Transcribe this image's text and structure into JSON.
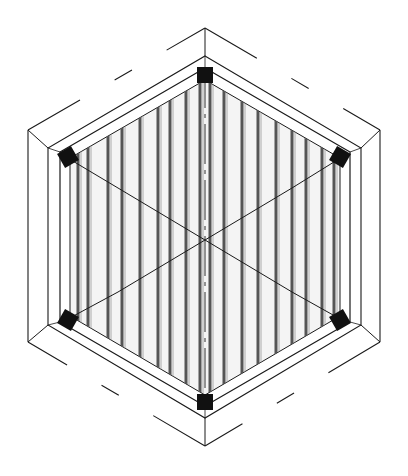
{
  "figure": {
    "type": "isometric technical drawing",
    "colors": {
      "background": "#ffffff",
      "line": "#1a1a1a",
      "fill_panel": "#f4f4f4",
      "slat_dark": "#555555",
      "block": "#111111"
    },
    "outer_hexagon": {
      "points": [
        [
          205,
          28
        ],
        [
          380,
          130
        ],
        [
          380,
          342
        ],
        [
          205,
          446
        ],
        [
          28,
          342
        ],
        [
          28,
          130
        ]
      ],
      "style": "partially dashed top/bottom edges"
    },
    "middle_hexagon": {
      "points": [
        [
          205,
          56
        ],
        [
          361,
          148
        ],
        [
          361,
          325
        ],
        [
          205,
          418
        ],
        [
          48,
          325
        ],
        [
          48,
          148
        ]
      ]
    },
    "inner_frame": {
      "points": [
        [
          205,
          68
        ],
        [
          350,
          152
        ],
        [
          350,
          322
        ],
        [
          205,
          406
        ],
        [
          60,
          322
        ],
        [
          60,
          152
        ]
      ]
    },
    "panel": {
      "points": [
        [
          205,
          80
        ],
        [
          340,
          158
        ],
        [
          340,
          316
        ],
        [
          205,
          395
        ],
        [
          70,
          316
        ],
        [
          70,
          158
        ]
      ]
    },
    "slats_x": [
      78,
      88,
      108,
      122,
      140,
      158,
      170,
      186,
      200,
      210,
      224,
      242,
      258,
      276,
      292,
      306,
      322,
      334
    ],
    "center": [
      205,
      240
    ],
    "axes_lines": [
      [
        [
          118,
          188
        ],
        [
          292,
          292
        ]
      ],
      [
        [
          292,
          188
        ],
        [
          118,
          292
        ]
      ],
      [
        [
          205,
          68
        ],
        [
          205,
          406
        ]
      ]
    ],
    "corner_rays": [
      [
        [
          66,
          157
        ],
        [
          118,
          188
        ]
      ],
      [
        [
          342,
          157
        ],
        [
          292,
          188
        ]
      ],
      [
        [
          66,
          320
        ],
        [
          118,
          292
        ]
      ],
      [
        [
          342,
          320
        ],
        [
          292,
          292
        ]
      ]
    ],
    "corner_blocks": [
      {
        "name": "top",
        "center": [
          205,
          75
        ]
      },
      {
        "name": "upper-left",
        "center": [
          68,
          157
        ]
      },
      {
        "name": "upper-right",
        "center": [
          340,
          157
        ]
      },
      {
        "name": "lower-left",
        "center": [
          68,
          320
        ]
      },
      {
        "name": "lower-right",
        "center": [
          340,
          320
        ]
      },
      {
        "name": "bottom",
        "center": [
          205,
          402
        ]
      }
    ]
  }
}
